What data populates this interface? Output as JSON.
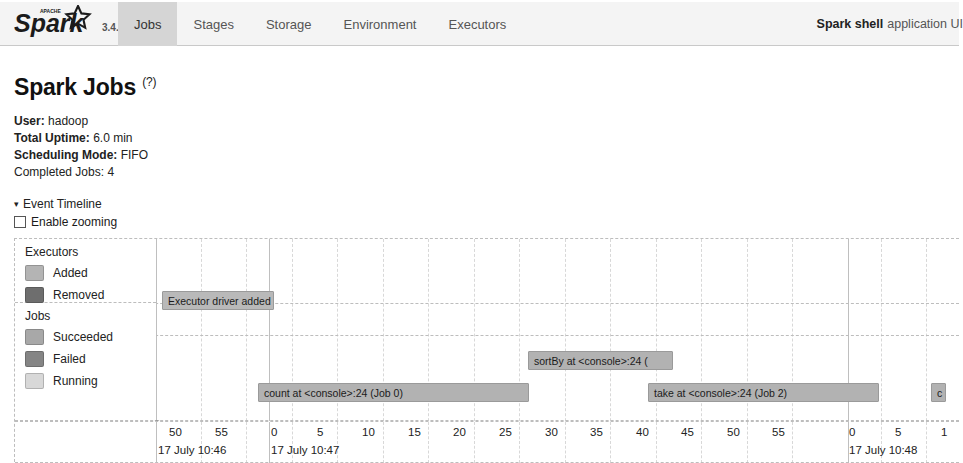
{
  "navbar": {
    "brand_name": "Spark",
    "brand_super": "APACHE",
    "version": "3.4.2",
    "tabs": [
      {
        "label": "Jobs",
        "active": true
      },
      {
        "label": "Stages",
        "active": false
      },
      {
        "label": "Storage",
        "active": false
      },
      {
        "label": "Environment",
        "active": false
      },
      {
        "label": "Executors",
        "active": false
      }
    ],
    "app_name": "Spark shell",
    "app_suffix": "application UI"
  },
  "page": {
    "title": "Spark Jobs",
    "title_help": "(?)",
    "meta": [
      {
        "label": "User:",
        "value": "hadoop"
      },
      {
        "label": "Total Uptime:",
        "value": "6.0 min"
      },
      {
        "label": "Scheduling Mode:",
        "value": "FIFO"
      },
      {
        "label": "Completed Jobs:",
        "value": "4"
      }
    ]
  },
  "event_timeline": {
    "section_label": "Event Timeline",
    "caret": "▾",
    "enable_zooming_label": "Enable zooming",
    "enable_zooming_checked": false,
    "legend": {
      "groups": [
        {
          "title": "Executors",
          "items": [
            {
              "label": "Added",
              "color": "#b4b4b4"
            },
            {
              "label": "Removed",
              "color": "#6e6e6e"
            }
          ]
        },
        {
          "title": "Jobs",
          "items": [
            {
              "label": "Succeeded",
              "color": "#a8a8a8"
            },
            {
              "label": "Failed",
              "color": "#858585"
            },
            {
              "label": "Running",
              "color": "#d8d8d8"
            }
          ]
        }
      ]
    },
    "bars": [
      {
        "name": "executor-driver-added",
        "label": "Executor driver added",
        "left": 161,
        "top": 52,
        "width": 112,
        "color": "#b9b9b9",
        "row": "executors"
      },
      {
        "name": "job-sortby",
        "label": "sortBy at <console>:24 (",
        "left": 527,
        "top": 112,
        "width": 145,
        "color": "#b2b2b2",
        "row": "jobs"
      },
      {
        "name": "job-count",
        "label": "count at <console>:24 (Job 0)",
        "left": 257,
        "top": 144,
        "width": 271,
        "color": "#b2b2b2",
        "row": "jobs"
      },
      {
        "name": "job-take",
        "label": "take at <console>:24 (Job 2)",
        "left": 647,
        "top": 144,
        "width": 231,
        "color": "#b2b2b2",
        "row": "jobs"
      },
      {
        "name": "job-partial-right",
        "label": "c",
        "left": 930,
        "top": 144,
        "width": 15,
        "color": "#b2b2b2",
        "row": "jobs"
      }
    ],
    "start_dot": {
      "left": 155,
      "top": 181
    },
    "axis": {
      "minor_ticks": [
        {
          "label": "50",
          "x": 168
        },
        {
          "label": "55",
          "x": 214
        },
        {
          "label": "0",
          "x": 270,
          "major": true,
          "group_label": "17 July 10:47"
        },
        {
          "label": "5",
          "x": 316
        },
        {
          "label": "10",
          "x": 361
        },
        {
          "label": "15",
          "x": 407
        },
        {
          "label": "20",
          "x": 452
        },
        {
          "label": "25",
          "x": 498
        },
        {
          "label": "30",
          "x": 544
        },
        {
          "label": "35",
          "x": 589
        },
        {
          "label": "40",
          "x": 635
        },
        {
          "label": "45",
          "x": 680
        },
        {
          "label": "50",
          "x": 726
        },
        {
          "label": "55",
          "x": 771
        },
        {
          "label": "0",
          "x": 848,
          "major": true,
          "group_label": "17 July 10:48"
        },
        {
          "label": "5",
          "x": 894
        },
        {
          "label": "1",
          "x": 940
        }
      ],
      "first_group_label": "17 July 10:46",
      "first_group_x": 155
    },
    "gridlines_major": [
      155,
      268,
      847
    ],
    "gridlines_minor": [
      200,
      245,
      291,
      336,
      382,
      427,
      473,
      518,
      564,
      609,
      655,
      700,
      746,
      791,
      880,
      925
    ],
    "hlines_y": [
      78,
      111,
      175
    ]
  }
}
